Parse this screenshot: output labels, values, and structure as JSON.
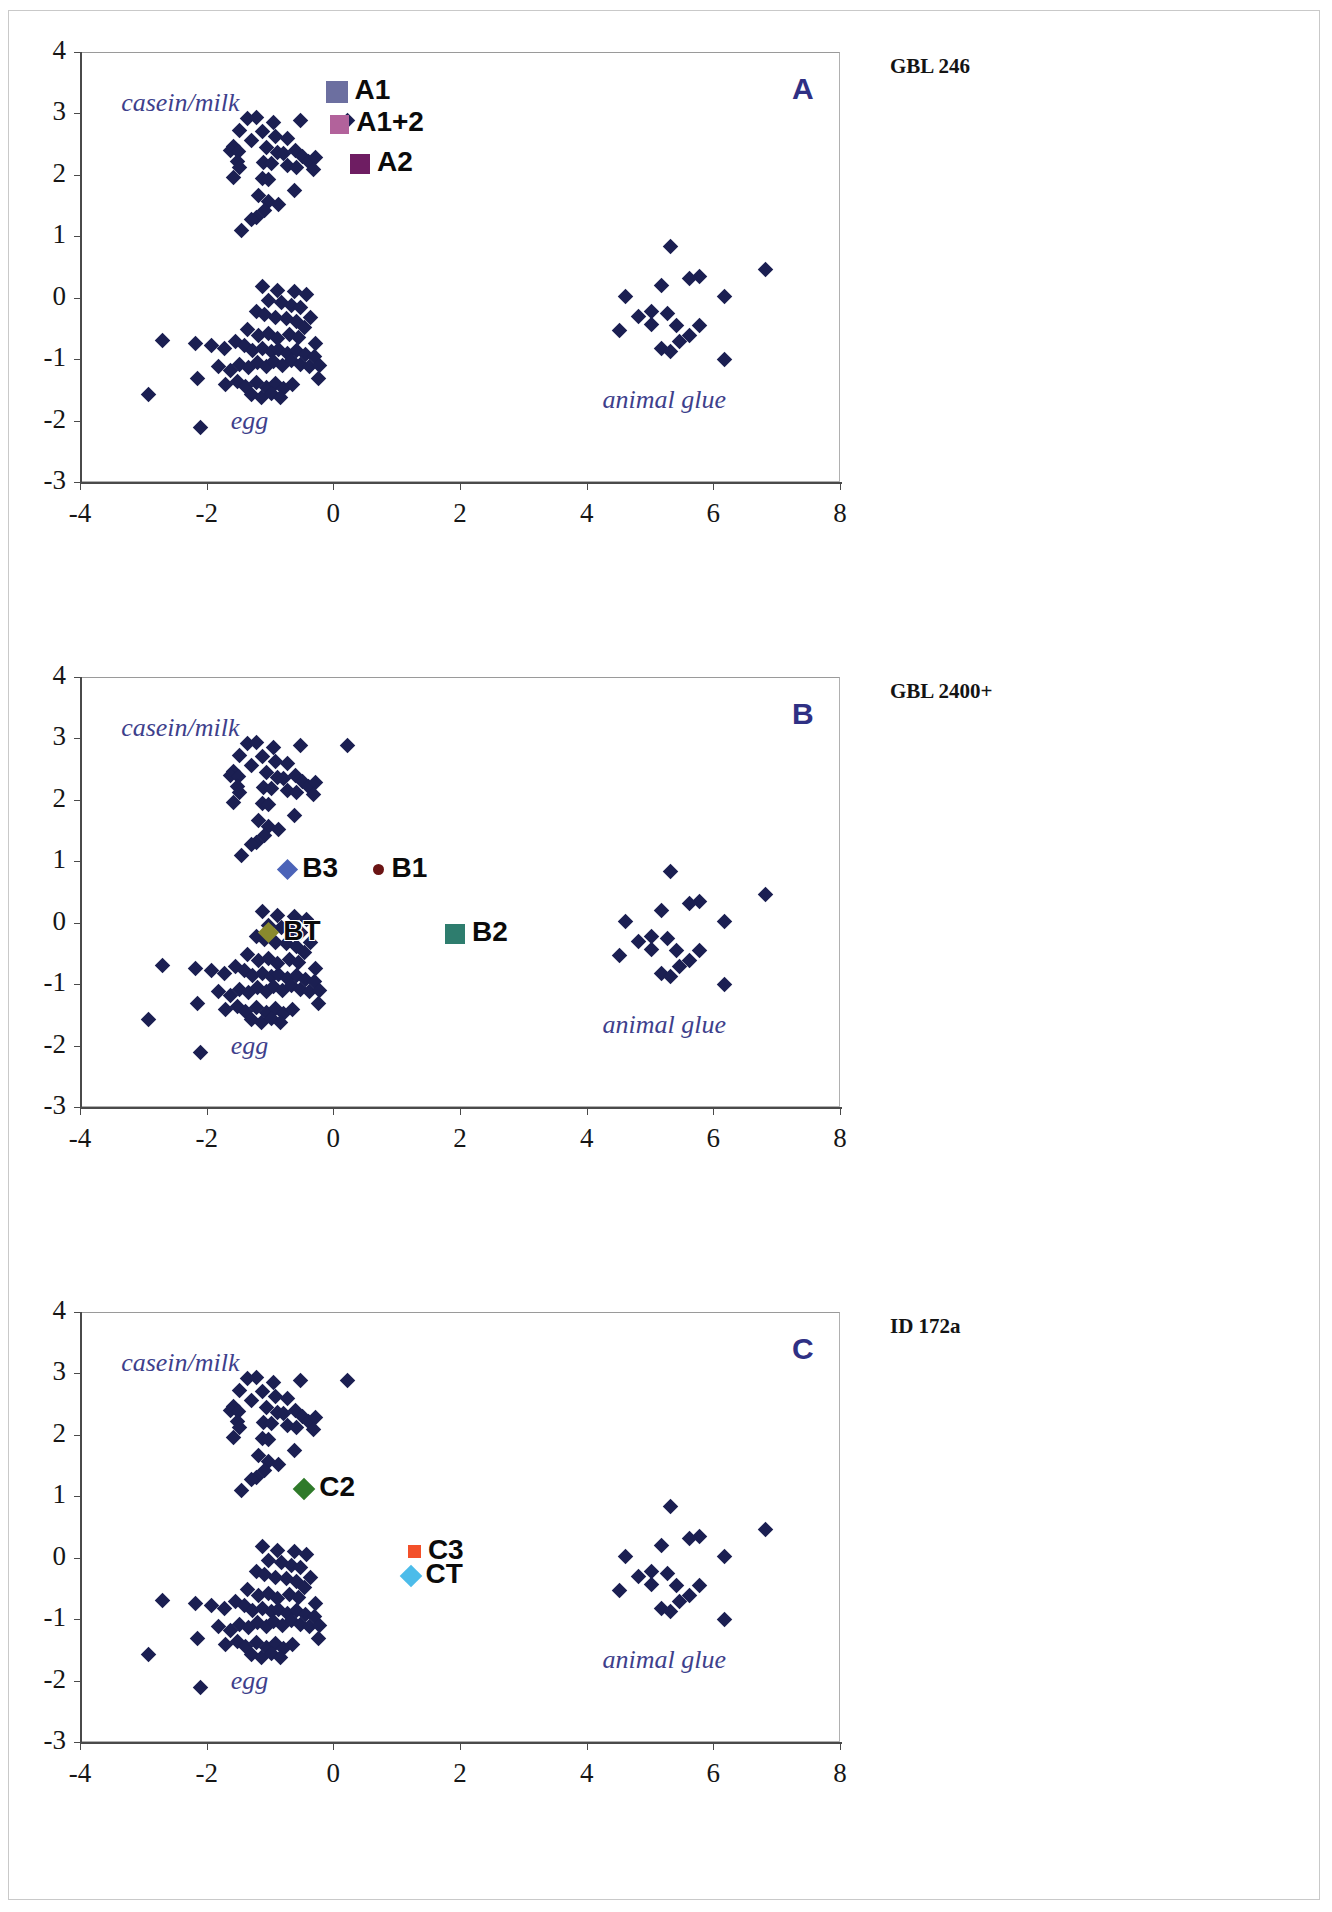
{
  "figure": {
    "axis": {
      "xmin": -4,
      "xmax": 8,
      "ymin": -3,
      "ymax": 4,
      "xticks": [
        "-4",
        "-2",
        "0",
        "2",
        "4",
        "6",
        "8"
      ],
      "yticks": [
        "4",
        "3",
        "2",
        "1",
        "0",
        "-1",
        "-2",
        "-3"
      ],
      "xtick_values": [
        -4,
        -2,
        0,
        2,
        4,
        6,
        8
      ],
      "ytick_values": [
        4,
        3,
        2,
        1,
        0,
        -1,
        -2,
        -3
      ]
    },
    "cluster_labels": {
      "casein": "casein/milk",
      "egg": "egg",
      "glue": "animal glue"
    },
    "colors": {
      "reference": "#1b1f52",
      "panel_letter": "#2f3084",
      "cluster_text": "#3e3f8c",
      "A1": "#6c6fa0",
      "A1_2": "#b2629b",
      "A2": "#6e1d62",
      "B1": "#6b1414",
      "B2": "#2e7d6e",
      "B3": "#4b63b8",
      "BT": "#8a8a2e",
      "C2": "#2f7a2a",
      "C3": "#f3502a",
      "CT": "#4cbcea"
    }
  },
  "panels": [
    {
      "id": "A",
      "letter": "A",
      "title": "GBL 246",
      "markers": [
        {
          "name": "A1",
          "label": "A1",
          "shape": "square",
          "color": "#6c6fa0",
          "x": 0.05,
          "y": 3.35,
          "size": 22
        },
        {
          "name": "A1+2",
          "label": "A1+2",
          "shape": "square",
          "color": "#b2629b",
          "x": 0.1,
          "y": 2.82,
          "size": 19
        },
        {
          "name": "A2",
          "label": "A2",
          "shape": "square",
          "color": "#6e1d62",
          "x": 0.42,
          "y": 2.18,
          "size": 20
        }
      ]
    },
    {
      "id": "B",
      "letter": "B",
      "title": "GBL 2400+",
      "markers": [
        {
          "name": "B3",
          "label": "B3",
          "shape": "diamond",
          "color": "#4b63b8",
          "x": -0.72,
          "y": 0.86,
          "size": 15
        },
        {
          "name": "B1",
          "label": "B1",
          "shape": "circle",
          "color": "#6b1414",
          "x": 0.72,
          "y": 0.86,
          "size": 11
        },
        {
          "name": "BT",
          "label": "BT",
          "shape": "diamond",
          "color": "#8a8a2e",
          "x": -1.02,
          "y": -0.16,
          "size": 15
        },
        {
          "name": "B2",
          "label": "B2",
          "shape": "square",
          "color": "#2e7d6e",
          "x": 1.92,
          "y": -0.18,
          "size": 20
        }
      ]
    },
    {
      "id": "C",
      "letter": "C",
      "title": "ID 172a",
      "markers": [
        {
          "name": "C2",
          "label": "C2",
          "shape": "diamond",
          "color": "#2f7a2a",
          "x": -0.46,
          "y": 1.12,
          "size": 16
        },
        {
          "name": "C3",
          "label": "C3",
          "shape": "square",
          "color": "#f3502a",
          "x": 1.28,
          "y": 0.1,
          "size": 13
        },
        {
          "name": "CT",
          "label": "CT",
          "shape": "diamond",
          "color": "#4cbcea",
          "x": 1.22,
          "y": -0.3,
          "size": 16
        }
      ]
    }
  ],
  "chart_data": {
    "type": "scatter",
    "title": "",
    "xlabel": "",
    "ylabel": "",
    "xlim": [
      -4,
      8
    ],
    "ylim": [
      -3,
      4
    ],
    "grid": false,
    "legend": "none",
    "note": "Three identical reference scatter panels (principal component style) with clusters casein/milk, egg and animal glue; each panel adds its own coloured sample markers.",
    "series": [
      {
        "name": "casein/milk",
        "color": "#1b1f52",
        "points": [
          [
            -1.35,
            2.92
          ],
          [
            -1.22,
            2.93
          ],
          [
            -0.95,
            2.85
          ],
          [
            -0.52,
            2.88
          ],
          [
            0.22,
            2.88
          ],
          [
            -1.48,
            2.72
          ],
          [
            -1.12,
            2.7
          ],
          [
            -1.3,
            2.56
          ],
          [
            -1.58,
            2.46
          ],
          [
            -1.62,
            2.4
          ],
          [
            -1.5,
            2.38
          ],
          [
            -1.05,
            2.44
          ],
          [
            -0.88,
            2.36
          ],
          [
            -0.78,
            2.34
          ],
          [
            -0.6,
            2.4
          ],
          [
            -0.48,
            2.3
          ],
          [
            -0.4,
            2.22
          ],
          [
            -0.28,
            2.28
          ],
          [
            -1.52,
            2.22
          ],
          [
            -1.48,
            2.12
          ],
          [
            -1.1,
            2.2
          ],
          [
            -0.98,
            2.18
          ],
          [
            -0.72,
            2.16
          ],
          [
            -0.58,
            2.12
          ],
          [
            -0.32,
            2.08
          ],
          [
            -1.58,
            1.96
          ],
          [
            -1.12,
            1.94
          ],
          [
            -1.02,
            1.92
          ],
          [
            -0.62,
            1.74
          ],
          [
            -1.02,
            1.56
          ],
          [
            -1.08,
            1.42
          ],
          [
            -1.22,
            1.3
          ],
          [
            -1.3,
            1.28
          ],
          [
            -1.45,
            1.1
          ],
          [
            -0.86,
            1.52
          ],
          [
            -1.18,
            1.66
          ],
          [
            -0.72,
            2.6
          ],
          [
            -0.92,
            2.62
          ]
        ]
      },
      {
        "name": "egg",
        "color": "#1b1f52",
        "points": [
          [
            -1.12,
            0.18
          ],
          [
            -0.88,
            0.12
          ],
          [
            -0.62,
            0.1
          ],
          [
            -0.42,
            0.06
          ],
          [
            -1.02,
            -0.05
          ],
          [
            -0.82,
            -0.08
          ],
          [
            -0.66,
            -0.12
          ],
          [
            -0.52,
            -0.16
          ],
          [
            -1.22,
            -0.22
          ],
          [
            -1.08,
            -0.28
          ],
          [
            -0.92,
            -0.32
          ],
          [
            -0.74,
            -0.34
          ],
          [
            -0.58,
            -0.38
          ],
          [
            -0.36,
            -0.32
          ],
          [
            -2.7,
            -0.7
          ],
          [
            -2.18,
            -0.74
          ],
          [
            -1.92,
            -0.78
          ],
          [
            -1.72,
            -0.82
          ],
          [
            -1.55,
            -0.72
          ],
          [
            -1.4,
            -0.78
          ],
          [
            -1.28,
            -0.86
          ],
          [
            -1.12,
            -0.82
          ],
          [
            -0.98,
            -0.88
          ],
          [
            -0.86,
            -0.84
          ],
          [
            -0.72,
            -0.9
          ],
          [
            -0.58,
            -0.86
          ],
          [
            -0.44,
            -0.92
          ],
          [
            -0.3,
            -0.96
          ],
          [
            -2.15,
            -1.32
          ],
          [
            -1.82,
            -1.12
          ],
          [
            -1.62,
            -1.18
          ],
          [
            -1.48,
            -1.08
          ],
          [
            -1.34,
            -1.14
          ],
          [
            -1.2,
            -1.06
          ],
          [
            -1.06,
            -1.12
          ],
          [
            -0.94,
            -1.04
          ],
          [
            -0.8,
            -1.1
          ],
          [
            -0.66,
            -1.02
          ],
          [
            -0.52,
            -1.08
          ],
          [
            -0.38,
            -1.12
          ],
          [
            -0.22,
            -1.1
          ],
          [
            -1.7,
            -1.42
          ],
          [
            -1.52,
            -1.36
          ],
          [
            -1.38,
            -1.44
          ],
          [
            -1.22,
            -1.38
          ],
          [
            -1.06,
            -1.46
          ],
          [
            -0.92,
            -1.4
          ],
          [
            -0.78,
            -1.48
          ],
          [
            -0.64,
            -1.42
          ],
          [
            -1.3,
            -1.58
          ],
          [
            -1.14,
            -1.62
          ],
          [
            -0.98,
            -1.56
          ],
          [
            -0.84,
            -1.62
          ],
          [
            -2.92,
            -1.58
          ],
          [
            -2.1,
            -2.12
          ],
          [
            -1.18,
            -0.62
          ],
          [
            -1.02,
            -0.58
          ],
          [
            -0.88,
            -0.66
          ],
          [
            -0.7,
            -0.6
          ],
          [
            -0.55,
            -0.64
          ],
          [
            -1.35,
            -0.52
          ],
          [
            -0.46,
            -0.48
          ],
          [
            -0.28,
            -0.74
          ],
          [
            -0.24,
            -1.32
          ]
        ]
      },
      {
        "name": "animal glue",
        "color": "#1b1f52",
        "points": [
          [
            5.32,
            0.84
          ],
          [
            5.78,
            0.34
          ],
          [
            5.62,
            0.32
          ],
          [
            6.82,
            0.46
          ],
          [
            4.62,
            0.02
          ],
          [
            5.18,
            0.2
          ],
          [
            6.18,
            0.02
          ],
          [
            4.52,
            -0.54
          ],
          [
            5.02,
            -0.44
          ],
          [
            5.42,
            -0.46
          ],
          [
            5.78,
            -0.46
          ],
          [
            5.02,
            -0.22
          ],
          [
            5.28,
            -0.26
          ],
          [
            5.46,
            -0.72
          ],
          [
            5.18,
            -0.82
          ],
          [
            5.32,
            -0.88
          ],
          [
            6.18,
            -1.0
          ],
          [
            4.82,
            -0.3
          ],
          [
            5.62,
            -0.62
          ]
        ]
      }
    ]
  }
}
